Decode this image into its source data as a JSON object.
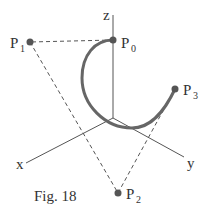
{
  "figure": {
    "caption": "Fig. 18",
    "axes": {
      "x": {
        "label": "x"
      },
      "y": {
        "label": "y"
      },
      "z": {
        "label": "z"
      }
    },
    "points": [
      {
        "name": "P",
        "sub": "0"
      },
      {
        "name": "P",
        "sub": "1"
      },
      {
        "name": "P",
        "sub": "2"
      },
      {
        "name": "P",
        "sub": "3"
      }
    ],
    "colors": {
      "curve": "#666666",
      "axis": "#555555",
      "control_polygon": "#555555",
      "point": "#555555",
      "text": "#333333"
    }
  }
}
